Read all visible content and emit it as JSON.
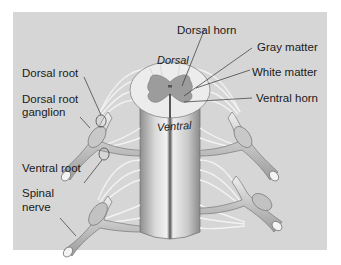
{
  "figure": {
    "colors": {
      "panel": "#d6d6d6",
      "nerve": "#b9b9b9",
      "nerve_light": "#e6e6e6",
      "gray_matter": "#9a9a9a",
      "white_matter": "#ececec",
      "leader_line": "#333333"
    }
  },
  "labels": {
    "dorsal_root": "Dorsal root",
    "dorsal_root_ganglion_line1": "Dorsal root",
    "dorsal_root_ganglion_line2": "ganglion",
    "ventral_root": "Ventral root",
    "spinal_nerve_line1": "Spinal",
    "spinal_nerve_line2": "nerve",
    "dorsal_horn": "Dorsal horn",
    "gray_matter": "Gray matter",
    "white_matter": "White matter",
    "ventral_horn": "Ventral horn"
  },
  "orientation": {
    "dorsal": "Dorsal",
    "ventral": "Ventral"
  }
}
